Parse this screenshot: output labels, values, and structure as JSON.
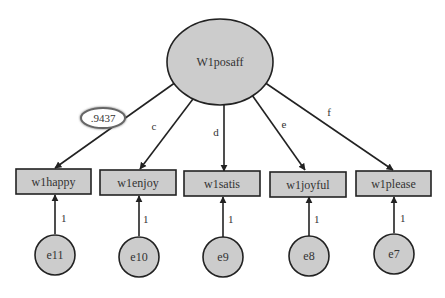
{
  "diagram": {
    "type": "structural-equation-model",
    "colors": {
      "node_fill": "#cccccc",
      "stroke": "#222222",
      "text": "#333333",
      "highlight_ring": "#555555",
      "background": "#ffffff"
    },
    "latent": {
      "id": "W1posaff",
      "label": "W1posaff"
    },
    "indicators": [
      {
        "id": "w1happy",
        "label": "w1happy",
        "loading_label": ".9437",
        "highlighted": true
      },
      {
        "id": "w1enjoy",
        "label": "w1enjoy",
        "loading_label": "c"
      },
      {
        "id": "w1satis",
        "label": "w1satis",
        "loading_label": "d"
      },
      {
        "id": "w1joyful",
        "label": "w1joyful",
        "loading_label": "e"
      },
      {
        "id": "w1please",
        "label": "w1please",
        "loading_label": "f"
      }
    ],
    "errors": [
      {
        "id": "e11",
        "label": "e11",
        "target": "w1happy",
        "path_label": "1"
      },
      {
        "id": "e10",
        "label": "e10",
        "target": "w1enjoy",
        "path_label": "1"
      },
      {
        "id": "e9",
        "label": "e9",
        "target": "w1satis",
        "path_label": "1"
      },
      {
        "id": "e8",
        "label": "e8",
        "target": "w1joyful",
        "path_label": "1"
      },
      {
        "id": "e7",
        "label": "e7",
        "target": "w1please",
        "path_label": "1"
      }
    ]
  }
}
